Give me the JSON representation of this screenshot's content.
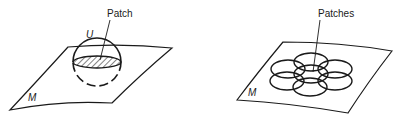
{
  "figure": {
    "left_panel": {
      "surface_label": "M",
      "neighborhood_label": "U",
      "callout_label": "Patch"
    },
    "right_panel": {
      "surface_label": "M",
      "callout_label": "Patches",
      "patch_count": 7
    },
    "colors": {
      "ink": "#1a1a1a",
      "background": "#ffffff"
    }
  }
}
